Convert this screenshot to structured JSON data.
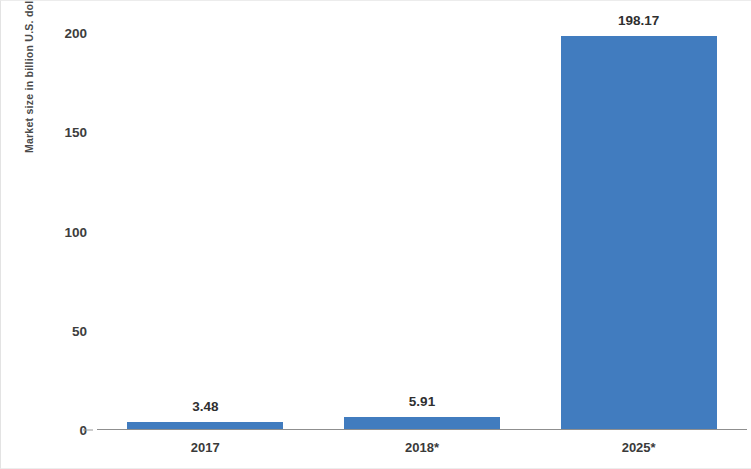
{
  "chart_data": {
    "type": "bar",
    "title": "",
    "subtitle": "",
    "xlabel": "",
    "ylabel": "Market size in billion U.S. dollars",
    "categories": [
      "2017",
      "2018*",
      "2025*"
    ],
    "values": [
      3.48,
      5.91,
      198.17
    ],
    "value_labels": [
      "3.48",
      "5.91",
      "198.17"
    ],
    "series": [
      {
        "name": "Market size",
        "values": [
          3.48,
          5.91,
          198.17
        ],
        "color": "#417cbf"
      }
    ],
    "ylim": [
      0,
      200
    ],
    "yticks": [
      0,
      50,
      100,
      150,
      200
    ],
    "ytick_labels": [
      "0",
      "50",
      "100",
      "150",
      "200"
    ],
    "grid": false,
    "legend": null,
    "legend_position": "none",
    "bar_color": "#417cbf",
    "axis_color": "#8f8f8f",
    "background": "#ffffff",
    "annotations": [
      "* denotes forecast/estimated value"
    ]
  }
}
